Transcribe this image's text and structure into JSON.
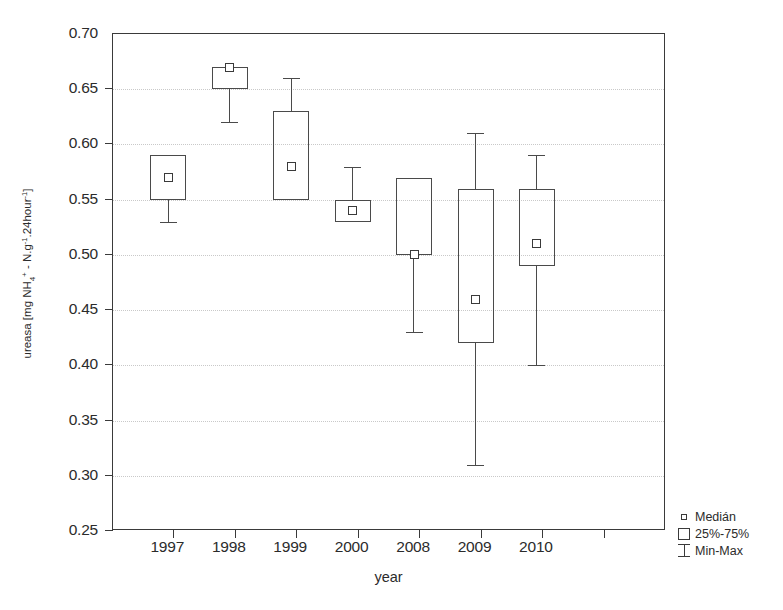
{
  "chart_data": {
    "type": "box",
    "title": "",
    "xlabel": "year",
    "ylabel": "ureasa [mg NH4+ - N.g-1.24hour-1]",
    "ylabel_parts": {
      "prefix": "ureasa [mg NH",
      "sub1": "4",
      "sup1": "+",
      "mid": " - N.g",
      "sup2": "-1",
      "mid2": ".24hour",
      "sup3": "-1",
      "suffix": "]"
    },
    "categories": [
      "1997",
      "1998",
      "1999",
      "2000",
      "2008",
      "2009",
      "2010"
    ],
    "ylim": [
      0.25,
      0.7
    ],
    "yticks": [
      "0.70",
      "0.65",
      "0.60",
      "0.55",
      "0.50",
      "0.45",
      "0.40",
      "0.35",
      "0.30",
      "0.25"
    ],
    "ytick_values": [
      0.7,
      0.65,
      0.6,
      0.55,
      0.5,
      0.45,
      0.4,
      0.35,
      0.3,
      0.25
    ],
    "grid": true,
    "legend_position": "bottom-right",
    "boxes": [
      {
        "category": "1997",
        "min": 0.53,
        "q1": 0.55,
        "median": 0.57,
        "q3": 0.59,
        "max": 0.59
      },
      {
        "category": "1998",
        "min": 0.62,
        "q1": 0.65,
        "median": 0.67,
        "q3": 0.67,
        "max": 0.67
      },
      {
        "category": "1999",
        "min": 0.55,
        "q1": 0.55,
        "median": 0.58,
        "q3": 0.63,
        "max": 0.66
      },
      {
        "category": "2000",
        "min": 0.53,
        "q1": 0.53,
        "median": 0.54,
        "q3": 0.55,
        "max": 0.58
      },
      {
        "category": "2008",
        "min": 0.43,
        "q1": 0.5,
        "median": 0.5,
        "q3": 0.57,
        "max": 0.57
      },
      {
        "category": "2009",
        "min": 0.31,
        "q1": 0.42,
        "median": 0.46,
        "q3": 0.56,
        "max": 0.61
      },
      {
        "category": "2010",
        "min": 0.4,
        "q1": 0.49,
        "median": 0.51,
        "q3": 0.56,
        "max": 0.59
      }
    ]
  },
  "legend": {
    "items": [
      {
        "symbol": "small-square",
        "label": "Medián"
      },
      {
        "symbol": "open-box",
        "label": "25%-75%"
      },
      {
        "symbol": "i-bar",
        "label": "Min-Max"
      }
    ]
  },
  "colors": {
    "axis": "#3a3a3a",
    "line": "#4a4a4a",
    "grid": "#c9c9c9",
    "background": "#ffffff",
    "text": "#2b2b2b"
  }
}
